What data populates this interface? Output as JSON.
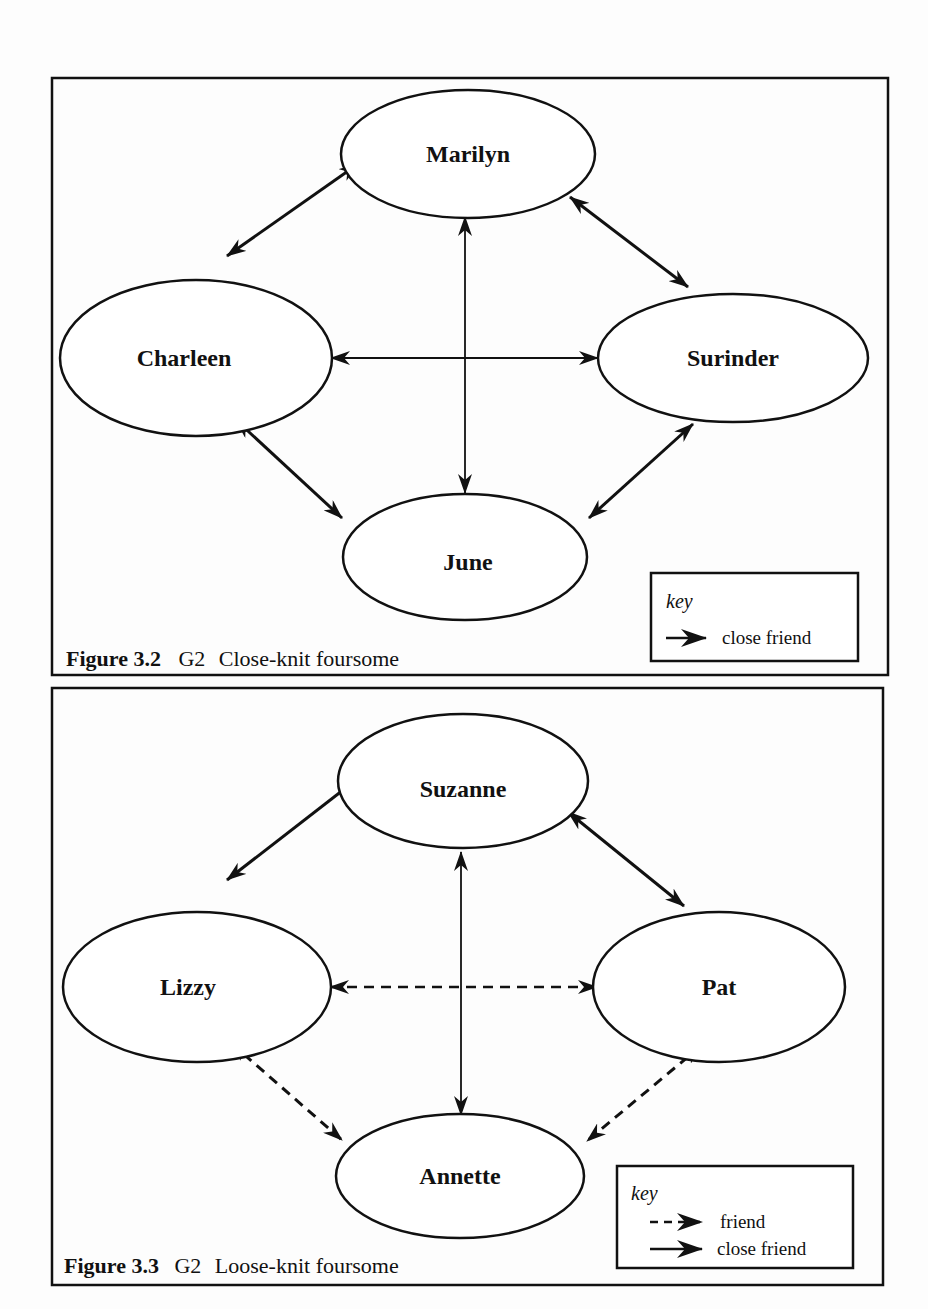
{
  "figures": [
    {
      "id": "fig32",
      "caption": {
        "number": "Figure  3.2",
        "group": "G2",
        "title": "Close-knit foursome"
      },
      "nodes": [
        {
          "id": "marilyn",
          "label": "Marilyn"
        },
        {
          "id": "charleen",
          "label": "Charleen"
        },
        {
          "id": "surinder",
          "label": "Surinder"
        },
        {
          "id": "june",
          "label": "June"
        }
      ],
      "edges": [
        {
          "from": "marilyn",
          "to": "charleen",
          "type": "close friend",
          "directed": "both"
        },
        {
          "from": "marilyn",
          "to": "surinder",
          "type": "close friend",
          "directed": "both"
        },
        {
          "from": "marilyn",
          "to": "june",
          "type": "close friend",
          "directed": "both"
        },
        {
          "from": "charleen",
          "to": "surinder",
          "type": "close friend",
          "directed": "both"
        },
        {
          "from": "charleen",
          "to": "june",
          "type": "close friend",
          "directed": "both"
        },
        {
          "from": "surinder",
          "to": "june",
          "type": "close friend",
          "directed": "both"
        }
      ],
      "key": {
        "title": "key",
        "entries": [
          {
            "style": "solid",
            "label": "close friend"
          }
        ]
      }
    },
    {
      "id": "fig33",
      "caption": {
        "number": "Figure  3.3",
        "group": "G2",
        "title": "Loose-knit foursome"
      },
      "nodes": [
        {
          "id": "suzanne",
          "label": "Suzanne"
        },
        {
          "id": "lizzy",
          "label": "Lizzy"
        },
        {
          "id": "pat",
          "label": "Pat"
        },
        {
          "id": "annette",
          "label": "Annette"
        }
      ],
      "edges": [
        {
          "from": "suzanne",
          "to": "lizzy",
          "type": "close friend",
          "directed": "both"
        },
        {
          "from": "suzanne",
          "to": "pat",
          "type": "close friend",
          "directed": "both"
        },
        {
          "from": "suzanne",
          "to": "annette",
          "type": "close friend",
          "directed": "both"
        },
        {
          "from": "lizzy",
          "to": "pat",
          "type": "friend",
          "directed": "both"
        },
        {
          "from": "lizzy",
          "to": "annette",
          "type": "friend",
          "directed": "both"
        },
        {
          "from": "pat",
          "to": "annette",
          "type": "friend",
          "directed": "both"
        }
      ],
      "key": {
        "title": "key",
        "entries": [
          {
            "style": "dashed",
            "label": "friend"
          },
          {
            "style": "solid",
            "label": "close friend"
          }
        ]
      }
    }
  ],
  "colors": {
    "ink": "#111111",
    "paper": "#fdfdfd"
  }
}
